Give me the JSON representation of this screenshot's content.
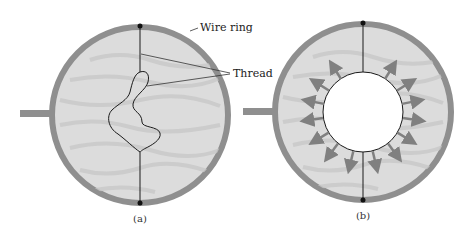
{
  "figure": {
    "panels": [
      {
        "id": "a",
        "caption": "(a)",
        "description": "Soap film in wire ring with loose thread loop"
      },
      {
        "id": "b",
        "caption": "(b)",
        "description": "Film inside loop punctured; thread pulled into circle by surface tension"
      }
    ],
    "labels": {
      "wire_ring": "Wire ring",
      "thread": "Thread"
    },
    "colors": {
      "ring": "#8f8f8f",
      "film": "#dcdcdc",
      "film_streak": "#c9c9c9",
      "thread": "#1a1a1a",
      "arrow": "#808080",
      "background": "#ffffff"
    },
    "arrow_count": 16
  }
}
